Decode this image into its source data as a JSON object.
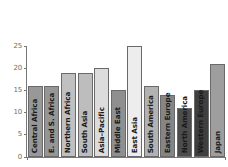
{
  "chart_data": {
    "type": "bar",
    "title": "",
    "subtitle": "",
    "xlabel": "",
    "ylabel": "",
    "grid": false,
    "legend": "none",
    "ylim": [
      0,
      26
    ],
    "yticks": [
      0,
      5,
      10,
      15,
      20,
      25
    ],
    "ytick_labels": [
      "0",
      "5",
      "10",
      "15",
      "20",
      "25"
    ],
    "categories": [
      "Central Africa",
      "E. and S. Africa",
      "Northern Africa",
      "South Asia",
      "Asia–Pacific",
      "Middle East",
      "East Asia",
      "South America",
      "Eastern Europe",
      "North America",
      "Western Europe",
      "Japan"
    ],
    "values": [
      16,
      16,
      19,
      19,
      20,
      15,
      25,
      16,
      14,
      11,
      15,
      21
    ],
    "bar_colors": [
      "#989898",
      "#969696",
      "#c0c0c0",
      "#bdbdbd",
      "#dcdcdc",
      "#8f8f8f",
      "#ededed",
      "#b2b2b2",
      "#858585",
      "#4c4c4c",
      "#3f3f3f",
      "#9e9e9e"
    ],
    "bar_edge_color": "#6a6a6a",
    "axis_color": "#777777",
    "tick_label_color": "#6e6e6e",
    "category_label_color": "#1a1a1a",
    "background_color": "#ffffff"
  }
}
